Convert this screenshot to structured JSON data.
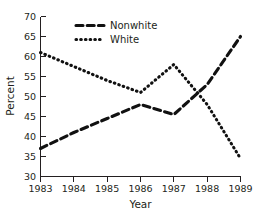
{
  "chart_data": {
    "type": "line",
    "title": "",
    "xlabel": "Year",
    "ylabel": "Percent",
    "x": [
      1983,
      1984,
      1985,
      1986,
      1987,
      1988,
      1989
    ],
    "categories": [
      "1983",
      "1984",
      "1985",
      "1986",
      "1987",
      "1988",
      "1989"
    ],
    "xlim": [
      1983,
      1989
    ],
    "ylim": [
      30,
      70
    ],
    "yticks": [
      30,
      35,
      40,
      45,
      50,
      55,
      60,
      65,
      70
    ],
    "ytick_labels": [
      "30",
      "35",
      "40",
      "45",
      "50",
      "55",
      "60",
      "65",
      "70"
    ],
    "xticks": [
      1983,
      1984,
      1985,
      1986,
      1987,
      1988,
      1989
    ],
    "xtick_labels": [
      "1983",
      "1984",
      "1985",
      "1986",
      "1987",
      "1988",
      "1989"
    ],
    "grid": false,
    "legend_position": "top-center",
    "series": [
      {
        "name": "Nonwhite",
        "style": "dashed",
        "color": "#111111",
        "values": [
          37,
          41,
          44.5,
          48,
          45.5,
          53,
          65
        ]
      },
      {
        "name": "White",
        "style": "dotted",
        "color": "#111111",
        "values": [
          61,
          57.5,
          54,
          51,
          58,
          48,
          34.5
        ]
      }
    ]
  },
  "axes": {
    "y_title": "Percent",
    "x_title": "Year"
  },
  "legend": {
    "entries": [
      {
        "label": "Nonwhite",
        "style": "dashed"
      },
      {
        "label": "White",
        "style": "dotted"
      }
    ]
  }
}
